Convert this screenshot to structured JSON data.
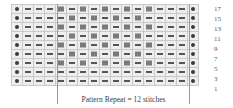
{
  "caption": {
    "text": "Pattern Repeat = 12 stitches"
  },
  "legend_symbols": {
    "dot": "purl-dot-symbol",
    "dash": "dash-symbol",
    "square": "filled-square-symbol"
  },
  "colors": {
    "grid_background": "#eeeeee",
    "grid_line": "#c9c9c9",
    "grid_border": "#b4b4b4",
    "dot": "#3a3a3a",
    "dash": "#555555",
    "square": "#7a7a7a",
    "text": "#3d3d3d",
    "marker_line": "#9a9a9a"
  },
  "chart_data": {
    "type": "table",
    "columns": 17,
    "rows": 9,
    "row_labels": [
      "17",
      "15",
      "13",
      "11",
      "9",
      "7",
      "5",
      "3",
      "1"
    ],
    "symbol_key": {
      "d": "dot",
      "-": "dash",
      "s": "square"
    },
    "grid": [
      [
        "d",
        "-",
        "-",
        "-",
        "s",
        "-",
        "s",
        "-",
        "s",
        "-",
        "s",
        "-",
        "s",
        "-",
        "-",
        "-",
        "d"
      ],
      [
        "d",
        "-",
        "-",
        "-",
        "-",
        "s",
        "-",
        "s",
        "-",
        "s",
        "-",
        "s",
        "-",
        "-",
        "-",
        "-",
        "d"
      ],
      [
        "d",
        "-",
        "-",
        "-",
        "s",
        "-",
        "s",
        "-",
        "s",
        "-",
        "s",
        "-",
        "s",
        "-",
        "-",
        "-",
        "d"
      ],
      [
        "d",
        "-",
        "-",
        "-",
        "-",
        "s",
        "-",
        "s",
        "-",
        "s",
        "-",
        "s",
        "-",
        "-",
        "-",
        "-",
        "d"
      ],
      [
        "d",
        "-",
        "-",
        "-",
        "s",
        "-",
        "s",
        "-",
        "s",
        "-",
        "s",
        "-",
        "s",
        "-",
        "-",
        "-",
        "d"
      ],
      [
        "d",
        "-",
        "-",
        "-",
        "-",
        "s",
        "-",
        "s",
        "-",
        "s",
        "-",
        "s",
        "-",
        "-",
        "-",
        "-",
        "d"
      ],
      [
        "d",
        "-",
        "-",
        "-",
        "s",
        "-",
        "s",
        "-",
        "s",
        "-",
        "s",
        "-",
        "s",
        "-",
        "-",
        "-",
        "d"
      ],
      [
        "d",
        "-",
        "-",
        "-",
        "-",
        "-",
        "-",
        "-",
        "-",
        "-",
        "-",
        "-",
        "-",
        "-",
        "-",
        "-",
        "d"
      ],
      [
        "d",
        "-",
        "-",
        "-",
        "-",
        "-",
        "-",
        "-",
        "-",
        "-",
        "-",
        "-",
        "-",
        "-",
        "-",
        "-",
        "d"
      ]
    ],
    "repeat": {
      "label": "Pattern Repeat = 12 stitches",
      "stitches": 12,
      "start_column": 5,
      "end_column": 16
    }
  }
}
